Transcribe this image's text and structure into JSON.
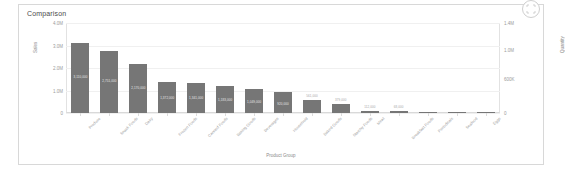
{
  "visual": {
    "title": "Comparison",
    "focus_icon": "focus-mode-icon"
  },
  "chart_data": {
    "type": "bar",
    "title": "Comparison",
    "xlabel": "Product Group",
    "ylabel": "Sales",
    "y2label": "Quantity",
    "ylim": [
      0,
      4000000
    ],
    "y2lim": [
      0,
      1400000
    ],
    "grid": true,
    "legend": "none",
    "y_ticks_left": [
      "4.0M",
      "3.0M",
      "2.0M",
      "1.0M",
      "0"
    ],
    "y_ticks_right": [
      "1.4M",
      "1.0M",
      "600K",
      "0"
    ],
    "categories": [
      "Produce",
      "Snack Foods",
      "Dairy",
      "Frozen Foods",
      "Canned Foods",
      "Baking Goods",
      "Beverages",
      "Household",
      "Baked Goods",
      "Starchy Foods",
      "Meat",
      "Breakfast Foods",
      "Periodicals",
      "Seafood",
      "Eggs"
    ],
    "values": [
      3110000,
      2750000,
      2170000,
      1370000,
      1340000,
      1180000,
      1050000,
      920000,
      560000,
      380000,
      110000,
      70000,
      40000,
      10000,
      5000
    ],
    "data_labels": [
      "3,110,000",
      "2,751,000",
      "2,170,000",
      "1,372,000",
      "1,341,000",
      "1,183,000",
      "1,049,000",
      "920,000",
      "561,000",
      "379,000",
      "112,000",
      "68,000",
      "",
      "",
      ""
    ]
  }
}
